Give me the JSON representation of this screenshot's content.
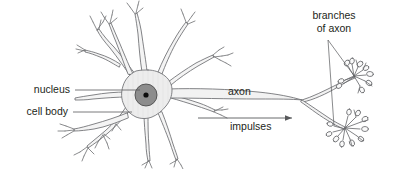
{
  "figure": {
    "background_color": "#ffffff",
    "line_color": "#6d6e71",
    "text_color": "#231f20",
    "soma_fill": "#ededed",
    "nucleus_fill": "#8d8d8d",
    "nucleolus_fill": "#0d0d0d"
  },
  "labels": {
    "nucleus": "nucleus",
    "cell_body": "cell body",
    "axon": "axon",
    "impulses": "impulses",
    "branches_of_axon_line1": "branches",
    "branches_of_axon_line2": "of axon"
  },
  "parts": {
    "dendrites": "dendrites",
    "soma": "cell-body",
    "nucleus": "nucleus",
    "nucleolus": "nucleolus",
    "axon": "axon",
    "axon_terminal_upper": "upper-axon-branch",
    "axon_terminal_lower": "lower-axon-branch"
  },
  "arrow": {
    "name": "impulse-direction-arrow",
    "direction": "right"
  }
}
